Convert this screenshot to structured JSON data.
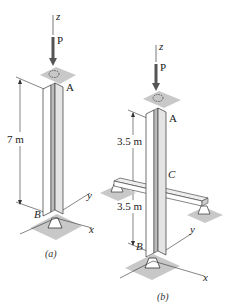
{
  "figure_a": {
    "caption": "(a)",
    "axis_z": "z",
    "axis_x": "x",
    "axis_y": "y",
    "load_label": "P",
    "top_point": "A",
    "bottom_point": "B",
    "length_label": "7 m"
  },
  "figure_b": {
    "caption": "(b)",
    "axis_z": "z",
    "axis_x": "x",
    "axis_y": "y",
    "load_label": "P",
    "top_point": "A",
    "mid_point": "C",
    "bottom_point": "B",
    "upper_length_label": "3.5 m",
    "lower_length_label": "3.5 m"
  },
  "colors": {
    "plate": "#c8c8c8",
    "column_face": "#ffffff",
    "column_side": "#d9d9d9",
    "line": "#333333",
    "arrow": "#555555"
  }
}
